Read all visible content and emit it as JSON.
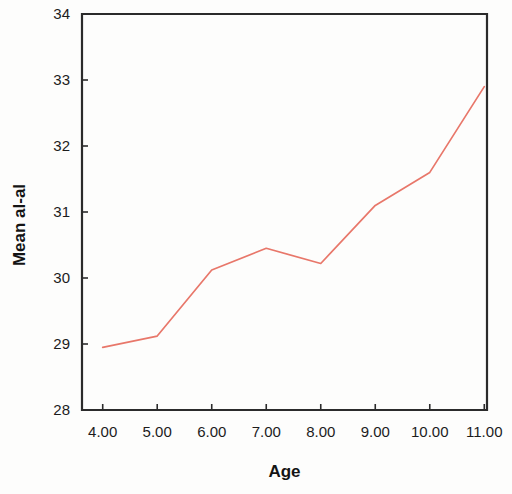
{
  "chart_data": {
    "type": "line",
    "title": "",
    "xlabel": "Age",
    "ylabel": "Mean al-al",
    "x": [
      4.0,
      5.0,
      6.0,
      7.0,
      8.0,
      9.0,
      10.0,
      11.0
    ],
    "values": [
      28.95,
      29.12,
      30.12,
      30.45,
      30.22,
      31.1,
      31.6,
      32.9
    ],
    "series": [
      {
        "name": "Mean al-al",
        "values": [
          28.95,
          29.12,
          30.12,
          30.45,
          30.22,
          31.1,
          31.6,
          32.9
        ]
      }
    ],
    "xtick_labels": [
      "4.00",
      "5.00",
      "6.00",
      "7.00",
      "8.00",
      "9.00",
      "10.00",
      "11.00"
    ],
    "ytick_labels": [
      "28",
      "29",
      "30",
      "31",
      "32",
      "33",
      "34"
    ],
    "ytick_values": [
      28,
      29,
      30,
      31,
      32,
      33,
      34
    ],
    "xlim": [
      3.62,
      11.05
    ],
    "ylim": [
      28,
      34
    ],
    "grid": false,
    "legend": "none",
    "line_color": "#e8776a",
    "axis_color": "#2b2b2b",
    "background_color": "#fdfdfc"
  }
}
